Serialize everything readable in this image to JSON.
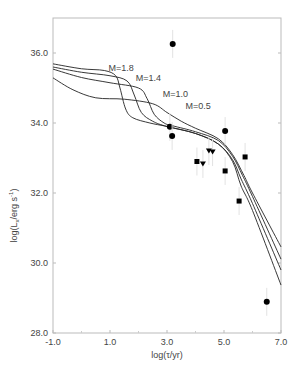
{
  "chart_data": {
    "type": "scatter",
    "title": "",
    "xlabel": "log(τ/yr)",
    "ylabel": "log(Lx/erg s-1)",
    "xlim": [
      -1.0,
      7.0
    ],
    "ylim": [
      28.0,
      37.0
    ],
    "xticks": [
      "-1.0",
      "1.0",
      "3.0",
      "5.0",
      "7.0"
    ],
    "yticks": [
      "28.0",
      "30.0",
      "32.0",
      "34.0",
      "36.0"
    ],
    "grid": false,
    "curve_labels": [
      {
        "text": "M=1.8",
        "x": 0.95,
        "y": 35.5
      },
      {
        "text": "M=1.4",
        "x": 1.9,
        "y": 35.2
      },
      {
        "text": "M=1.0",
        "x": 2.85,
        "y": 34.75
      },
      {
        "text": "M=0.5",
        "x": 3.65,
        "y": 34.4
      }
    ],
    "series": [
      {
        "name": "M=1.8",
        "kind": "line",
        "x": [
          -1.0,
          0.0,
          0.8,
          1.2,
          1.35,
          1.55,
          1.8,
          2.4,
          3.0,
          4.0,
          4.8,
          5.3,
          5.6,
          6.0,
          7.0
        ],
        "y": [
          35.69,
          35.55,
          35.5,
          35.35,
          35.0,
          34.4,
          34.15,
          34.0,
          33.9,
          33.7,
          33.4,
          32.9,
          32.2,
          31.5,
          29.37
        ]
      },
      {
        "name": "M=1.4",
        "kind": "line",
        "x": [
          -1.0,
          0.0,
          1.0,
          1.6,
          1.85,
          2.1,
          2.5,
          3.0,
          4.0,
          4.8,
          5.3,
          5.6,
          6.0,
          7.0
        ],
        "y": [
          35.6,
          35.45,
          35.35,
          35.2,
          34.8,
          34.3,
          34.05,
          33.9,
          33.7,
          33.4,
          32.95,
          32.4,
          31.7,
          29.8
        ]
      },
      {
        "name": "M=1.0",
        "kind": "line",
        "x": [
          -1.0,
          0.0,
          1.0,
          2.0,
          2.3,
          2.55,
          2.9,
          3.2,
          4.0,
          4.8,
          5.3,
          5.65,
          6.0,
          7.0
        ],
        "y": [
          35.54,
          35.3,
          35.15,
          35.0,
          34.7,
          34.25,
          34.0,
          33.92,
          33.75,
          33.5,
          33.05,
          32.5,
          31.9,
          30.11
        ]
      },
      {
        "name": "M=0.5",
        "kind": "line",
        "x": [
          -1.0,
          -0.3,
          0.5,
          1.5,
          2.5,
          3.0,
          3.5,
          4.0,
          4.8,
          5.3,
          5.7,
          6.0,
          7.0
        ],
        "y": [
          35.29,
          34.95,
          34.72,
          34.68,
          34.55,
          34.3,
          34.05,
          33.85,
          33.55,
          33.1,
          32.5,
          32.0,
          30.46
        ]
      },
      {
        "name": "circles",
        "kind": "marker",
        "marker": "circle",
        "x": [
          3.2,
          3.1,
          3.18,
          5.04,
          6.5
        ],
        "y": [
          36.26,
          33.89,
          33.63,
          33.77,
          28.89
        ]
      },
      {
        "name": "squares",
        "kind": "marker",
        "marker": "square",
        "x": [
          4.05,
          5.04,
          5.74,
          5.53
        ],
        "y": [
          32.9,
          32.63,
          33.03,
          31.77
        ]
      },
      {
        "name": "triangles",
        "kind": "marker",
        "marker": "triangle-down",
        "x": [
          4.47,
          4.6,
          4.26
        ],
        "y": [
          33.2,
          33.17,
          32.83
        ]
      }
    ]
  }
}
